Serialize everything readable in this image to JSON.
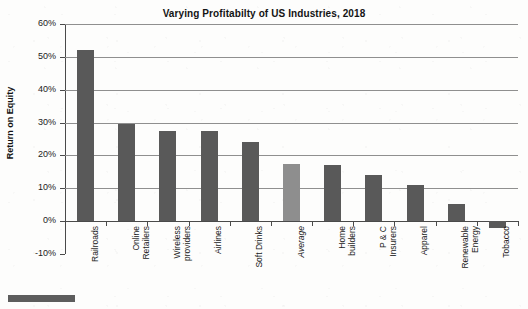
{
  "chart_data": {
    "type": "bar",
    "title": "Varying Profitabilty of US Industries, 2018",
    "xlabel": "",
    "ylabel": "Return on Equity",
    "ylim": [
      -10,
      60
    ],
    "ytick_labels": [
      "60%",
      "50%",
      "40%",
      "30%",
      "20%",
      "10%",
      "0%",
      "-10%"
    ],
    "ytick_values": [
      60,
      50,
      40,
      30,
      20,
      10,
      0,
      -10
    ],
    "grid": true,
    "legend": false,
    "value_unit": "percent",
    "categories": [
      "Railroads",
      "Online Retailers",
      "Wireless providers",
      "Airlines",
      "Soft Drinks",
      "Average",
      "Home builders",
      "P & C Insurers",
      "Apparel",
      "Renewable Energy",
      "Tobacco"
    ],
    "values": [
      52,
      29.7,
      27.5,
      27.5,
      24,
      17.5,
      17,
      14,
      11,
      5.2,
      -2
    ],
    "highlight_index": 5,
    "colors": {
      "bar": "#595959",
      "average_bar": "#8e8e8e",
      "gridline": "#8f8f8f",
      "axis": "#4a4a4a",
      "text": "#1b1b1b",
      "background": "#fdfdfc"
    }
  },
  "labels": {
    "category_display": [
      "Railroads",
      "Online\nRetailers",
      "Wireless\nproviders",
      "Airlines",
      "Soft Drinks",
      "Average",
      "Home\nbuilders",
      "P & C\nInsurers",
      "Apparel",
      "Renewable\nEnergy",
      "Tobacco"
    ]
  }
}
